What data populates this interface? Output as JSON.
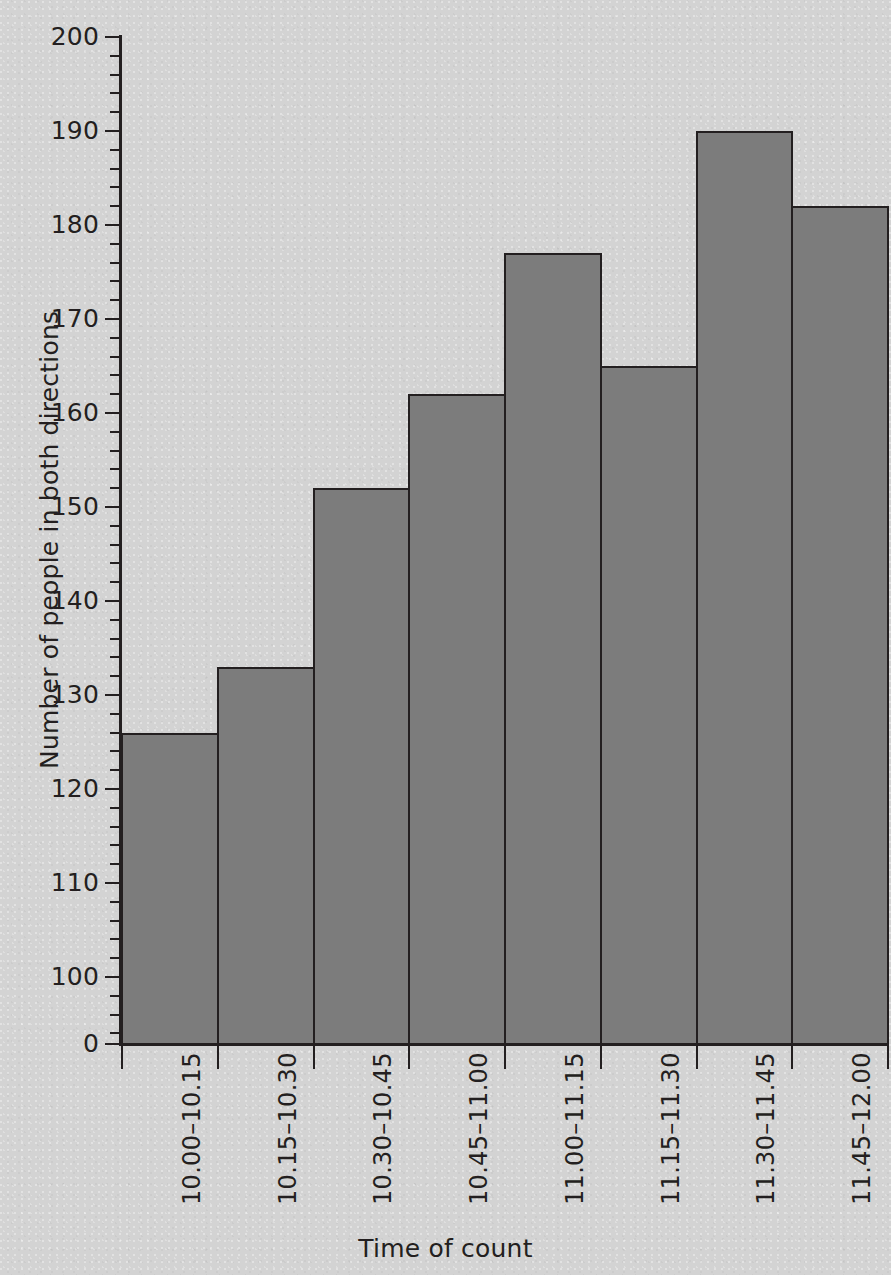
{
  "chart_data": {
    "type": "bar",
    "title": "",
    "xlabel": "Time of count",
    "ylabel": "Number of people in both directions",
    "categories": [
      "10.00–10.15",
      "10.15–10.30",
      "10.30–10.45",
      "10.45–11.00",
      "11.00–11.15",
      "11.15–11.30",
      "11.30–11.45",
      "11.45–12.00"
    ],
    "values": [
      126,
      133,
      152,
      162,
      177,
      165,
      190,
      182
    ],
    "ylim": [
      0,
      200
    ],
    "y_axis_broken": true,
    "y_baseline_label": "0",
    "y_major_tick_labels": [
      "200",
      "190",
      "180",
      "170",
      "160",
      "150",
      "140",
      "130",
      "120",
      "110",
      "100",
      "0"
    ],
    "y_major_tick_values": [
      200,
      190,
      180,
      170,
      160,
      150,
      140,
      130,
      120,
      110,
      100,
      0
    ],
    "y_minor_tick_step": 2,
    "grid": false,
    "legend": null,
    "bar_fill_color": "#7c7c7c",
    "bar_edge_color": "#231f20",
    "background_color": "#d3d3d3",
    "text_color": "#231f20"
  }
}
